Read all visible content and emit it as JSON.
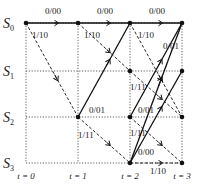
{
  "diagram": {
    "type": "trellis",
    "states": [
      {
        "id": "S0",
        "label": "S",
        "sub": "0",
        "y": 23
      },
      {
        "id": "S1",
        "label": "S",
        "sub": "1",
        "y": 71
      },
      {
        "id": "S2",
        "label": "S",
        "sub": "2",
        "y": 117
      },
      {
        "id": "S3",
        "label": "S",
        "sub": "3",
        "y": 163
      }
    ],
    "times": [
      {
        "label": "t = 0",
        "x": 26
      },
      {
        "label": "t = 1",
        "x": 78
      },
      {
        "label": "t = 2",
        "x": 130
      },
      {
        "label": "t = 3",
        "x": 182
      }
    ],
    "nodes": [
      {
        "t": 0,
        "s": 0
      },
      {
        "t": 1,
        "s": 0
      },
      {
        "t": 1,
        "s": 2
      },
      {
        "t": 2,
        "s": 0
      },
      {
        "t": 2,
        "s": 1
      },
      {
        "t": 2,
        "s": 2
      },
      {
        "t": 2,
        "s": 3
      },
      {
        "t": 3,
        "s": 0
      },
      {
        "t": 3,
        "s": 1
      },
      {
        "t": 3,
        "s": 2
      },
      {
        "t": 3,
        "s": 3
      }
    ],
    "edges": [
      {
        "from": [
          0,
          0
        ],
        "to": [
          1,
          0
        ],
        "style": "solid",
        "label": "0/00",
        "lx": 45,
        "ly": 14
      },
      {
        "from": [
          0,
          0
        ],
        "to": [
          1,
          2
        ],
        "style": "dashed",
        "label": "1/10",
        "lx": 32,
        "ly": 38
      },
      {
        "from": [
          1,
          0
        ],
        "to": [
          2,
          0
        ],
        "style": "solid",
        "label": "0/00",
        "lx": 97,
        "ly": 14
      },
      {
        "from": [
          1,
          0
        ],
        "to": [
          2,
          1
        ],
        "style": "dashed",
        "label": "1/10",
        "lx": 84,
        "ly": 38
      },
      {
        "from": [
          1,
          2
        ],
        "to": [
          2,
          0
        ],
        "style": "solid",
        "label": "0/01",
        "lx": 89,
        "ly": 113
      },
      {
        "from": [
          1,
          2
        ],
        "to": [
          2,
          3
        ],
        "style": "dashed",
        "label": "1/11",
        "lx": 78,
        "ly": 138
      },
      {
        "from": [
          2,
          0
        ],
        "to": [
          3,
          0
        ],
        "style": "solid",
        "label": "0/00",
        "lx": 149,
        "ly": 14
      },
      {
        "from": [
          2,
          0
        ],
        "to": [
          3,
          2
        ],
        "style": "dashed",
        "label": "1/10",
        "lx": 138,
        "ly": 38
      },
      {
        "from": [
          2,
          1
        ],
        "to": [
          3,
          2
        ],
        "style": "dashed",
        "label": "1/11",
        "lx": 130,
        "ly": 90
      },
      {
        "from": [
          2,
          2
        ],
        "to": [
          3,
          0
        ],
        "style": "solid",
        "label": "0/01",
        "lx": 163,
        "ly": 49
      },
      {
        "from": [
          2,
          2
        ],
        "to": [
          3,
          3
        ],
        "style": "dashed",
        "label": "1/11",
        "lx": 130,
        "ly": 136
      },
      {
        "from": [
          2,
          3
        ],
        "to": [
          3,
          0
        ],
        "style": "solid",
        "label": "0/01",
        "lx": 138,
        "ly": 113
      },
      {
        "from": [
          2,
          3
        ],
        "to": [
          3,
          3
        ],
        "style": "dashed",
        "label": "1/10",
        "lx": 150,
        "ly": 174
      },
      {
        "from": [
          2,
          3
        ],
        "to": [
          3,
          1
        ],
        "style": "solid",
        "label": "0/00",
        "lx": 138,
        "ly": 155
      }
    ]
  }
}
